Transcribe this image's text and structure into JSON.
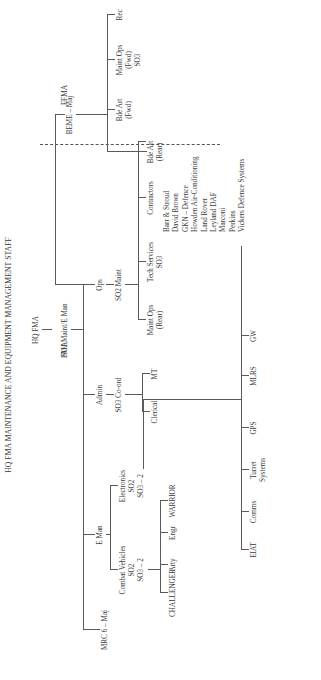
{
  "title": "HQ FMA MAINTENANCE AND EQUIPMENT MANAGEMENT STAFF",
  "regions": {
    "fma": "FMA",
    "ffma": "FFMA"
  },
  "root": {
    "name": "HQ FMA",
    "post": "SO1 Maint/E Man"
  },
  "mrc": "MRC 6 – Maj",
  "e_man": {
    "label": "E Man",
    "combat_vehicles": {
      "line1": "Combat Vehicles",
      "line2": "SO2",
      "line3": "SO3 – 2",
      "children": [
        "CHALLENGER",
        "Arty",
        "Engr",
        "WARRIOR"
      ]
    },
    "electronics": {
      "line1": "Electronics",
      "line2": "SO2",
      "line3": "SO3 – 2",
      "children": [
        "EIAT",
        "Comms",
        "Turret",
        "Systems",
        "GPS",
        "MLRS",
        "GW"
      ]
    }
  },
  "admin": {
    "label": "Admin",
    "post": "SO3 Co-ord",
    "children": [
      "Clerical",
      "MT"
    ]
  },
  "ops": {
    "label": "Ops",
    "post": "SO2 Maint",
    "maint_ops_rear": {
      "line1": "Maint Ops",
      "line2": "(Rear)"
    },
    "tech_services": {
      "line1": "Tech Services",
      "line2": "SO3"
    },
    "contractors": {
      "label": "Contractors",
      "items": [
        "Barr & Stroud",
        "David Brown",
        "GKN – Defence",
        "Howden Air-Conditioning",
        "Land Rover",
        "Leyland DAF",
        "Marconi",
        "Perkins",
        "Vickers Defence Systems"
      ]
    },
    "bde_art_rear": {
      "line1": "Bde Art",
      "line2": "(Rear)"
    }
  },
  "beme": {
    "label": "BEME – Maj",
    "bde_art_fwd": {
      "line1": "Bde Art",
      "line2": "(Fwd)"
    },
    "maint_ops_fwd": {
      "line1": "Maint Ops",
      "line2": "(Fwd)",
      "line3": "SO3"
    },
    "rec": "Rec"
  }
}
